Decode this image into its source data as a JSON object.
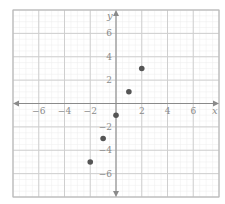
{
  "chart_data": {
    "type": "scatter",
    "title": "",
    "xlabel": "x",
    "ylabel": "y",
    "xlim": [
      -8,
      8
    ],
    "ylim": [
      -8,
      8
    ],
    "grid": true,
    "major_grid_step": 2,
    "x_ticks": [
      -6,
      -4,
      -2,
      2,
      4,
      6
    ],
    "y_ticks": [
      6,
      4,
      2,
      -2,
      -4,
      -6
    ],
    "x_tick_labels": [
      "−6",
      "−4",
      "−2",
      "2",
      "4",
      "6"
    ],
    "y_tick_labels": [
      "6",
      "4",
      "2",
      "−2",
      "−4",
      "−6"
    ],
    "series": [
      {
        "name": "points",
        "points": [
          {
            "x": -2,
            "y": -5
          },
          {
            "x": -1,
            "y": -3
          },
          {
            "x": 0,
            "y": -1
          },
          {
            "x": 1,
            "y": 1
          },
          {
            "x": 2,
            "y": 3
          }
        ]
      }
    ]
  },
  "colors": {
    "point": "#555555",
    "axis": "#8a8a8a",
    "major_grid": "#cfcfcf",
    "minor_grid": "#ececec",
    "border": "#b8b8b8",
    "label": "#8a8a8a"
  }
}
